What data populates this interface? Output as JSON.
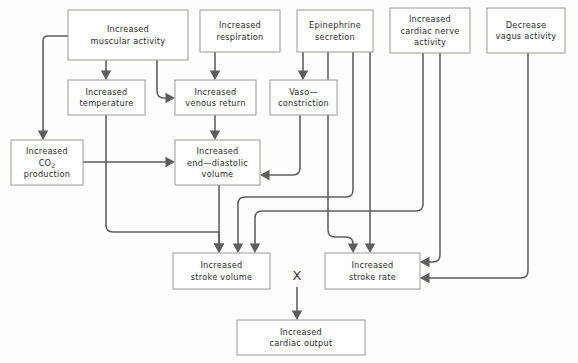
{
  "diagram": {
    "canvas": {
      "width": 578,
      "height": 363,
      "background": "#fdfdfc"
    },
    "style": {
      "box_fill": "#ffffff",
      "box_stroke": "#9a9a98",
      "edge_color": "#5d5d5d",
      "text_color": "#2b2b2b"
    },
    "nodes": [
      {
        "id": "muscular",
        "name": "increased-muscular-activity",
        "lines": [
          "Increased",
          "muscular activity"
        ],
        "x": 68,
        "y": 10,
        "w": 120,
        "h": 50
      },
      {
        "id": "respiration",
        "name": "increased-respiration",
        "lines": [
          "Increased",
          "respiration"
        ],
        "x": 200,
        "y": 10,
        "w": 80,
        "h": 42
      },
      {
        "id": "epinephrine",
        "name": "epinephrine-secretion",
        "lines": [
          "Epinephrine",
          "secretion"
        ],
        "x": 297,
        "y": 10,
        "w": 76,
        "h": 42
      },
      {
        "id": "cardiac-nerve",
        "name": "increased-cardiac-nerve-activity",
        "lines": [
          "Increased",
          "cardiac nerve",
          "activity"
        ],
        "x": 390,
        "y": 8,
        "w": 80,
        "h": 45
      },
      {
        "id": "vagus",
        "name": "decrease-vagus-activity",
        "lines": [
          "Decrease",
          "vagus activity"
        ],
        "x": 487,
        "y": 8,
        "w": 78,
        "h": 45
      },
      {
        "id": "temperature",
        "name": "increased-temperature",
        "lines": [
          "Increased",
          "temperature"
        ],
        "x": 68,
        "y": 80,
        "w": 77,
        "h": 35
      },
      {
        "id": "venous",
        "name": "increased-venous-return",
        "lines": [
          "Increased",
          "venous return"
        ],
        "x": 175,
        "y": 80,
        "w": 81,
        "h": 35
      },
      {
        "id": "vaso",
        "name": "vasoconstriction",
        "lines": [
          "Vaso—",
          "constriction"
        ],
        "x": 270,
        "y": 80,
        "w": 67,
        "h": 35
      },
      {
        "id": "co2",
        "name": "increased-co2-production",
        "lines": [
          "Increased",
          "CO2",
          "production"
        ],
        "x": 11,
        "y": 140,
        "w": 72,
        "h": 45,
        "subscript_line": 1,
        "subscript_base": "CO",
        "subscript_text": "2"
      },
      {
        "id": "edv",
        "name": "increased-end-diastolic-volume",
        "lines": [
          "Increased",
          "end—diastolic",
          "volume"
        ],
        "x": 175,
        "y": 140,
        "w": 85,
        "h": 45
      },
      {
        "id": "stroke-volume",
        "name": "increased-stroke-volume",
        "lines": [
          "Increased",
          "stroke volume"
        ],
        "x": 173,
        "y": 253,
        "w": 97,
        "h": 36
      },
      {
        "id": "stroke-rate",
        "name": "increased-stroke-rate",
        "lines": [
          "Increased",
          "stroke rate"
        ],
        "x": 325,
        "y": 253,
        "w": 95,
        "h": 36
      },
      {
        "id": "cardiac-output",
        "name": "increased-cardiac-output",
        "lines": [
          "Increased",
          "cardiac output"
        ],
        "x": 237,
        "y": 320,
        "w": 128,
        "h": 35
      }
    ],
    "operator": {
      "name": "multiplication-operator",
      "symbol": "X",
      "x": 297,
      "y": 275
    },
    "edges": [
      {
        "name": "edge-muscular-to-co2",
        "from": "muscular",
        "to": "co2",
        "path": "M 68 36 L 48 36 Q 43 36 43 41 L 43 131",
        "arrow": {
          "x": 43,
          "y": 140,
          "dir": "down"
        }
      },
      {
        "name": "edge-muscular-to-temperature",
        "from": "muscular",
        "to": "temperature",
        "path": "M 106 60 L 106 71",
        "arrow": {
          "x": 106,
          "y": 80,
          "dir": "down"
        }
      },
      {
        "name": "edge-muscular-to-venous",
        "from": "muscular",
        "to": "venous",
        "path": "M 157 60 L 157 91 Q 157 98 164 98 L 166 98",
        "arrow": {
          "x": 175,
          "y": 98,
          "dir": "right"
        }
      },
      {
        "name": "edge-respiration-to-venous",
        "from": "respiration",
        "to": "venous",
        "path": "M 215 52 L 215 71",
        "arrow": {
          "x": 215,
          "y": 80,
          "dir": "down"
        }
      },
      {
        "name": "edge-epinephrine-to-vaso",
        "from": "epinephrine",
        "to": "vaso",
        "path": "M 303 52 L 303 71",
        "arrow": {
          "x": 303,
          "y": 80,
          "dir": "down"
        }
      },
      {
        "name": "edge-venous-to-edv",
        "from": "venous",
        "to": "edv",
        "path": "M 215 115 L 215 131",
        "arrow": {
          "x": 215,
          "y": 140,
          "dir": "down"
        }
      },
      {
        "name": "edge-co2-to-edv",
        "from": "co2",
        "to": "edv",
        "path": "M 83 162 L 166 162",
        "arrow": {
          "x": 175,
          "y": 162,
          "dir": "right"
        }
      },
      {
        "name": "edge-vaso-to-edv",
        "from": "vaso",
        "to": "edv",
        "path": "M 300 115 L 300 168 Q 300 175 293 175 L 269 175",
        "arrow": {
          "x": 260,
          "y": 175,
          "dir": "left"
        }
      },
      {
        "name": "edge-temperature-to-stroke-volume",
        "from": "temperature",
        "to": "stroke-volume",
        "path": "M 106 115 L 106 225 Q 106 232 113 232 L 219 232 L 219 244",
        "arrow": {
          "x": 219,
          "y": 253,
          "dir": "down"
        }
      },
      {
        "name": "edge-edv-to-stroke-volume",
        "from": "edv",
        "to": "stroke-volume",
        "path": "M 219 185 L 219 244",
        "arrow": {
          "x": 219,
          "y": 253,
          "dir": "down"
        }
      },
      {
        "name": "edge-epinephrine-to-stroke-volume",
        "from": "epinephrine",
        "to": "stroke-volume",
        "path": "M 353 52 L 353 190 Q 353 197 346 197 L 245 197 Q 238 197 238 204 L 238 244",
        "arrow": {
          "x": 238,
          "y": 253,
          "dir": "down"
        }
      },
      {
        "name": "edge-cardiac-nerve-to-stroke-volume",
        "from": "cardiac-nerve",
        "to": "stroke-volume",
        "path": "M 423 53 L 423 204 Q 423 211 416 211 L 262 211 Q 255 211 255 218 L 255 244",
        "arrow": {
          "x": 255,
          "y": 253,
          "dir": "down"
        }
      },
      {
        "name": "edge-epinephrine-to-stroke-rate",
        "from": "epinephrine",
        "to": "stroke-rate",
        "path": "M 370 52 L 370 244",
        "arrow": {
          "x": 370,
          "y": 253,
          "dir": "down"
        }
      },
      {
        "name": "edge-vaso-line-to-stroke-rate",
        "from": "vaso",
        "to": "stroke-rate",
        "path": "M 328 52 L 328 230 Q 328 237 335 237 L 346 237 Q 353 237 353 244 L 353 244",
        "arrow": {
          "x": 353,
          "y": 253,
          "dir": "down"
        }
      },
      {
        "name": "edge-cardiac-nerve-to-stroke-rate",
        "from": "cardiac-nerve",
        "to": "stroke-rate",
        "path": "M 440 53 L 440 255 Q 440 262 433 262 L 429 262",
        "arrow": {
          "x": 420,
          "y": 262,
          "dir": "left"
        }
      },
      {
        "name": "edge-vagus-to-stroke-rate",
        "from": "vagus",
        "to": "stroke-rate",
        "path": "M 528 53 L 528 271 Q 528 278 521 278 L 429 278",
        "arrow": {
          "x": 420,
          "y": 278,
          "dir": "left"
        }
      },
      {
        "name": "edge-operator-to-cardiac-output",
        "from": "operator",
        "to": "cardiac-output",
        "path": "M 297 287 L 297 311",
        "arrow": {
          "x": 297,
          "y": 320,
          "dir": "down"
        }
      }
    ]
  }
}
